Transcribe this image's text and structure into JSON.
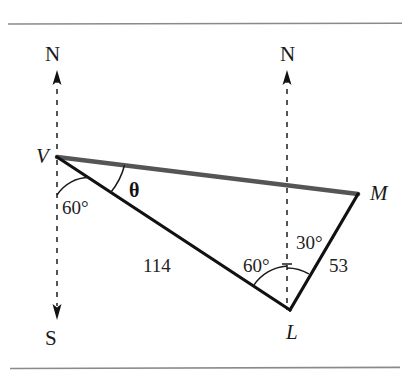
{
  "figure": {
    "type": "bearing-triangle-diagram",
    "background_color": "#ffffff",
    "rules": {
      "top_label": "top-rule",
      "bottom_label": "bottom-rule",
      "color": "#8a8a8a"
    },
    "vertices": [
      {
        "id": "V",
        "label": "V",
        "x": 57,
        "y": 157
      },
      {
        "id": "L",
        "label": "L",
        "x": 290,
        "y": 310
      },
      {
        "id": "M",
        "label": "M",
        "x": 358,
        "y": 194
      }
    ],
    "compass_labels": [
      {
        "id": "north-left",
        "label": "N",
        "x": 52,
        "y": 57
      },
      {
        "id": "south-left",
        "label": "S",
        "x": 52,
        "y": 340
      },
      {
        "id": "north-right",
        "label": "N",
        "x": 287,
        "y": 57
      }
    ],
    "angles": [
      {
        "id": "angle-at-v",
        "label": "60°",
        "value": 60,
        "vertex": "V",
        "x": 73,
        "y": 208
      },
      {
        "id": "angle-theta",
        "label": "θ",
        "value": null,
        "vertex": "V",
        "x": 135,
        "y": 190
      },
      {
        "id": "angle-at-l",
        "label": "60°",
        "value": 60,
        "vertex": "L",
        "x": 262,
        "y": 265
      },
      {
        "id": "angle-at-l-east",
        "label": "30°",
        "value": 30,
        "vertex": "L",
        "x": 312,
        "y": 243
      }
    ],
    "side_lengths": [
      {
        "id": "side-vl",
        "label": "114",
        "value": 114,
        "from": "V",
        "to": "L",
        "x": 155,
        "y": 265
      },
      {
        "id": "side-lm",
        "label": "53",
        "value": 53,
        "from": "L",
        "to": "M",
        "x": 338,
        "y": 265
      }
    ],
    "segments": [
      {
        "id": "segment-vm",
        "from": "V",
        "to": "M",
        "style": "thick-gray",
        "color": "#555555"
      },
      {
        "id": "segment-vl",
        "from": "V",
        "to": "L",
        "style": "solid-black",
        "color": "#111111"
      },
      {
        "id": "segment-lm",
        "from": "L",
        "to": "M",
        "style": "solid-black",
        "color": "#111111"
      }
    ],
    "meridians": [
      {
        "id": "meridian-left",
        "x": 57,
        "top_y": 75,
        "bottom_y": 315,
        "arrow_top": true,
        "arrow_bottom": true
      },
      {
        "id": "meridian-right",
        "x": 287,
        "top_y": 75,
        "bottom_y": 310,
        "arrow_top": true,
        "arrow_bottom": false
      }
    ]
  }
}
